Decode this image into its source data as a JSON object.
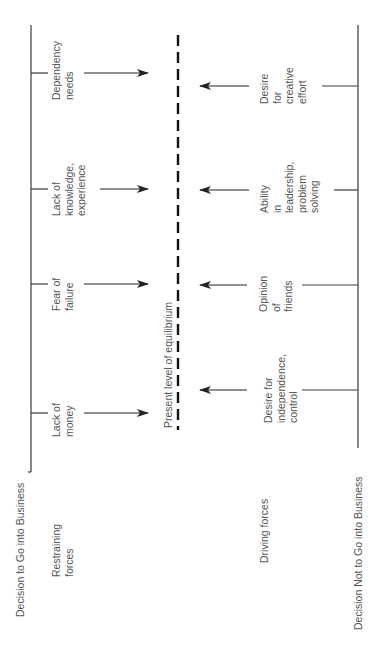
{
  "diagram": {
    "type": "force-field-analysis",
    "orientation": "rotated-90-ccw",
    "colors": {
      "line": "#3a3a3a",
      "text": "#555555",
      "background": "#ffffff"
    },
    "top_pole": "Decision to Go into Business",
    "bottom_pole": "Decision Not to Go into Business",
    "equilibrium_label": "Present level of equilibrium",
    "restraining": {
      "heading": [
        "Restraining",
        "forces"
      ],
      "forces": [
        {
          "lines": [
            "Lack of",
            "money"
          ]
        },
        {
          "lines": [
            "Fear of",
            "failure"
          ]
        },
        {
          "lines": [
            "Lack of",
            "knowledge,",
            "experience"
          ]
        },
        {
          "lines": [
            "Dependency",
            "needs"
          ]
        }
      ]
    },
    "driving": {
      "heading": [
        "Driving forces"
      ],
      "forces": [
        {
          "lines": [
            "Desire for",
            "independence,",
            "control"
          ]
        },
        {
          "lines": [
            "Opinion",
            "of",
            "friends"
          ]
        },
        {
          "lines": [
            "Ability",
            "in",
            "leadership,",
            "problem",
            "solving"
          ]
        },
        {
          "lines": [
            "Desire",
            "for",
            "creative",
            "effort"
          ]
        }
      ]
    }
  }
}
